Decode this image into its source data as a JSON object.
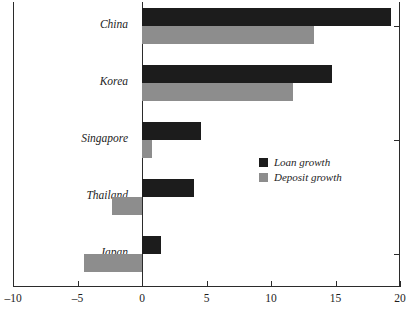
{
  "chart_data": {
    "type": "bar",
    "orientation": "horizontal",
    "title": "",
    "subtitle": "",
    "xlabel": "",
    "ylabel": "",
    "categories": [
      "China",
      "Korea",
      "Singapore",
      "Thailand",
      "Japan"
    ],
    "series": [
      {
        "name": "Loan growth",
        "color": "#1c1c1c",
        "values": [
          19.3,
          14.7,
          4.6,
          4.0,
          1.5
        ]
      },
      {
        "name": "Deposit growth",
        "color": "#8d8d8d",
        "values": [
          13.3,
          11.7,
          0.8,
          -2.3,
          -4.5
        ]
      }
    ],
    "xlim": [
      -10,
      20
    ],
    "xticks": [
      -10,
      -5,
      0,
      5,
      10,
      15,
      20
    ],
    "xtick_labels": [
      "–10",
      "–5",
      "0",
      "5",
      "10",
      "15",
      "20"
    ],
    "grid": false,
    "legend_position": "center-right",
    "zero_line": true
  },
  "legend": {
    "entries": [
      {
        "label": "Loan growth",
        "swatch": "loan-swatch"
      },
      {
        "label": "Deposit growth",
        "swatch": "deposit-swatch"
      }
    ]
  },
  "colors": {
    "loan": "#1c1c1c",
    "deposit": "#8d8d8d",
    "axis": "#2b2b2b",
    "text": "#1d1d1d",
    "background": "#ffffff"
  }
}
